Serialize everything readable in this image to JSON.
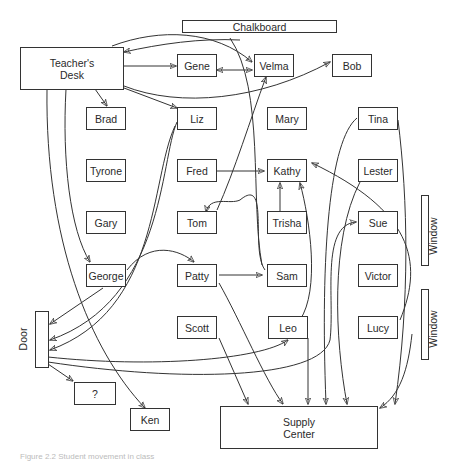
{
  "diagram": {
    "type": "classroom-movement-map",
    "fixtures": {
      "chalkboard": "Chalkboard",
      "teachers_desk": "Teacher's Desk",
      "door": "Door",
      "window_upper": "Window",
      "window_lower": "Window",
      "supply_center": "Supply Center",
      "unknown": "?"
    },
    "students": {
      "gene": "Gene",
      "velma": "Velma",
      "bob": "Bob",
      "brad": "Brad",
      "liz": "Liz",
      "mary": "Mary",
      "tina": "Tina",
      "tyrone": "Tyrone",
      "fred": "Fred",
      "kathy": "Kathy",
      "lester": "Lester",
      "gary": "Gary",
      "tom": "Tom",
      "trisha": "Trisha",
      "sue": "Sue",
      "george": "George",
      "patty": "Patty",
      "sam": "Sam",
      "victor": "Victor",
      "scott": "Scott",
      "leo": "Leo",
      "lucy": "Lucy",
      "ken": "Ken"
    },
    "edges": [
      {
        "from": "Teacher's Desk",
        "to": "Gene"
      },
      {
        "from": "Teacher's Desk",
        "to": "Velma"
      },
      {
        "from": "Velma",
        "to": "Teacher's Desk"
      },
      {
        "from": "Gene",
        "to": "Velma",
        "bidirectional": true
      },
      {
        "from": "Teacher's Desk",
        "to": "Bob"
      },
      {
        "from": "Teacher's Desk",
        "to": "Brad"
      },
      {
        "from": "Teacher's Desk",
        "to": "Liz"
      },
      {
        "from": "Teacher's Desk",
        "to": "George"
      },
      {
        "from": "Teacher's Desk",
        "to": "Ken"
      },
      {
        "from": "Tom",
        "to": "Velma"
      },
      {
        "from": "Fred",
        "to": "Kathy"
      },
      {
        "from": "Trisha",
        "to": "Kathy"
      },
      {
        "from": "Patty",
        "to": "Sam"
      },
      {
        "from": "George",
        "to": "Patty"
      },
      {
        "from": "George",
        "to": "Door"
      },
      {
        "from": "Liz",
        "to": "Door"
      },
      {
        "from": "Sam",
        "to": "Tom"
      },
      {
        "from": "Door",
        "to": "?"
      },
      {
        "from": "Door",
        "to": "Leo"
      },
      {
        "from": "Door",
        "to": "Sue"
      },
      {
        "from": "Leo",
        "to": "Kathy"
      },
      {
        "from": "Lucy",
        "to": "Kathy"
      },
      {
        "from": "Scott",
        "to": "Supply Center"
      },
      {
        "from": "Patty",
        "to": "Supply Center"
      },
      {
        "from": "Leo",
        "to": "Supply Center"
      },
      {
        "from": "Tina",
        "to": "Supply Center"
      },
      {
        "from": "Lester",
        "to": "Supply Center"
      },
      {
        "from": "Sue",
        "to": "Supply Center"
      }
    ]
  },
  "caption": "Figure 2.2  Student movement in class"
}
